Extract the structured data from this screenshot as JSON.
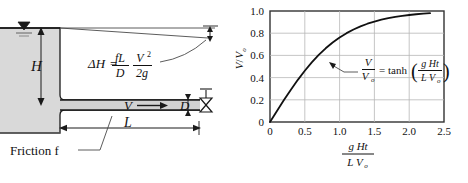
{
  "figure": {
    "left_diagram": {
      "name": "reservoir-pipe-schematic",
      "labels": {
        "head": "H",
        "length": "L",
        "diameter": "D",
        "velocity": "V",
        "friction": "Friction f",
        "head_loss_symbol": "ΔH",
        "head_loss_equals": "=",
        "head_loss_num1": "fL",
        "head_loss_den1": "D",
        "head_loss_num2": "V",
        "head_loss_num2_exp": "2",
        "head_loss_den2": "2g"
      },
      "colors": {
        "water_fill": "#d9d9d9",
        "pipe_fill": "#d2d2d2",
        "line": "#1a1a1a",
        "ground": "#808080"
      }
    },
    "right_chart": {
      "name": "velocity-ratio-plot",
      "annotation": {
        "lhs_num": "V",
        "lhs_den": "V",
        "lhs_den_sub": "o",
        "equals": "=",
        "func": "tanh",
        "paren_open": "(",
        "arg_num": "g Ht",
        "arg_den": "L V",
        "arg_den_sub": "o",
        "paren_close": ")"
      }
    }
  },
  "chart_data": {
    "type": "line",
    "title": "",
    "xlabel_num": "g Ht",
    "xlabel_den": "L V",
    "xlabel_den_sub": "o",
    "ylabel_num": "V",
    "ylabel_den": "V",
    "ylabel_den_sub": "o",
    "equation": "V/Vo = tanh(g Ht / (L Vo))",
    "xlim": [
      0,
      2.5
    ],
    "ylim": [
      0,
      1.0
    ],
    "xticks": [
      0,
      0.5,
      1.0,
      1.5,
      2.0,
      2.5
    ],
    "xticklabels": [
      "0",
      "0.5",
      "1.0",
      "1.5",
      "2.0",
      "2.5"
    ],
    "yticks": [
      0,
      0.2,
      0.4,
      0.6,
      0.8,
      1.0
    ],
    "yticklabels": [
      "0",
      "0.2",
      "0.4",
      "0.6",
      "0.8",
      "1.0"
    ],
    "grid": true,
    "legend": "none",
    "series": [
      {
        "name": "V/Vo = tanh(x)",
        "x": [
          0.0,
          0.1,
          0.2,
          0.3,
          0.4,
          0.5,
          0.6,
          0.7,
          0.8,
          0.9,
          1.0,
          1.1,
          1.2,
          1.3,
          1.4,
          1.5,
          1.6,
          1.7,
          1.8,
          1.9,
          2.0,
          2.1,
          2.2,
          2.3
        ],
        "y": [
          0.0,
          0.0997,
          0.1974,
          0.2913,
          0.3799,
          0.4621,
          0.537,
          0.6044,
          0.664,
          0.7163,
          0.7616,
          0.8005,
          0.8337,
          0.8617,
          0.8854,
          0.9051,
          0.9217,
          0.9354,
          0.9468,
          0.9562,
          0.964,
          0.9705,
          0.9757,
          0.9801
        ],
        "color": "#111111"
      }
    ],
    "colors": {
      "axis": "#333333",
      "grid": "#b8b8b8",
      "curve": "#111111",
      "text": "#111111"
    }
  }
}
